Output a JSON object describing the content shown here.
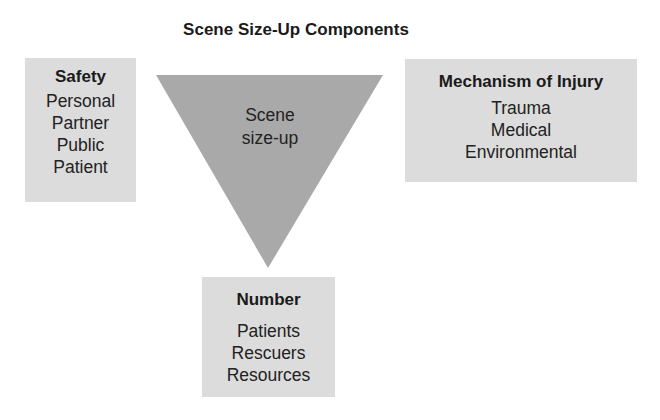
{
  "title": "Scene Size-Up Components",
  "center": {
    "label_line1": "Scene",
    "label_line2": "size-up",
    "fill_color": "#a9a9a9"
  },
  "safety": {
    "heading": "Safety",
    "items": [
      "Personal",
      "Partner",
      "Public",
      "Patient"
    ]
  },
  "mechanism": {
    "heading": "Mechanism of Injury",
    "items": [
      "Trauma",
      "Medical",
      "Environmental"
    ]
  },
  "number": {
    "heading": "Number",
    "items": [
      "Patients",
      "Rescuers",
      "Resources"
    ]
  },
  "colors": {
    "box_fill": "#dcdcdc",
    "triangle_fill": "#a9a9a9",
    "text": "#1a1a1a"
  }
}
